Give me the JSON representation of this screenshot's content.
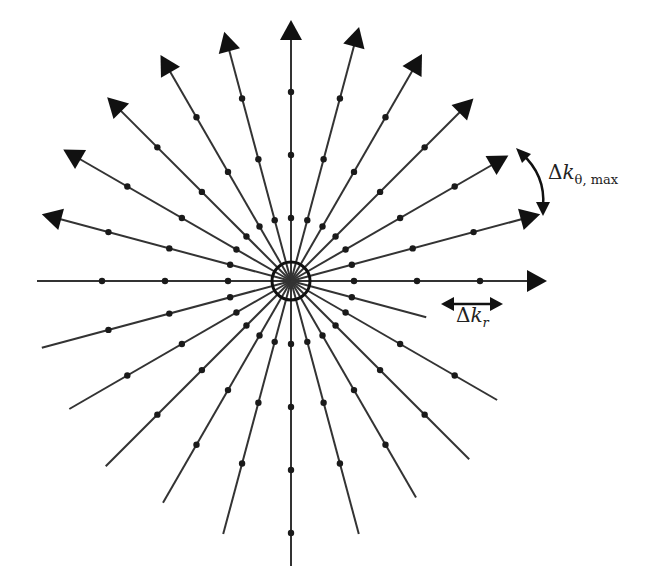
{
  "figure": {
    "center": [
      291,
      281
    ],
    "spoke_angle_step_deg": 15,
    "spoke_count": 24,
    "line_color": "#333333",
    "sample_color": "#1a1a1a",
    "labels": {
      "delta_theta": {
        "prefix": "Δ",
        "var": "k",
        "sub": "θ, max"
      },
      "delta_r": {
        "prefix": "Δ",
        "var": "k",
        "sub": "r"
      }
    }
  },
  "chart_data": {
    "type": "diagram",
    "spokes_upper_with_arrows_deg": [
      0,
      15,
      30,
      45,
      60,
      75,
      90,
      105,
      120,
      135,
      150,
      165
    ],
    "spokes_lower_plain_deg": [
      180,
      195,
      210,
      225,
      240,
      255,
      270,
      285,
      300,
      315,
      330,
      345
    ],
    "sample_spacing_px": 63,
    "annotations": [
      "Δk_θ,max (angular spacing between spokes)",
      "Δk_r (radial sample spacing)"
    ]
  }
}
